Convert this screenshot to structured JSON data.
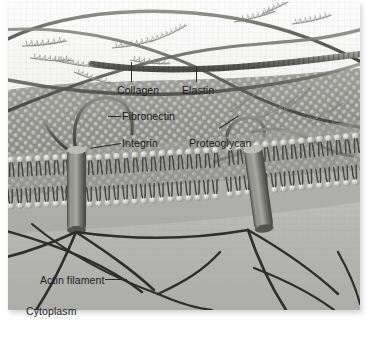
{
  "figure": {
    "style": "grayscale textbook illustration",
    "colors": {
      "background": "#ffffff",
      "plate_top": "#fbfbfb",
      "extracellular_matrix": "#9a9a98",
      "cytoplasm": "#b9b9b6",
      "fiber_dark": "#3a3a3a",
      "fiber_mid": "#6e6e6c",
      "label_text": "#1b1b1b",
      "leader_line": "#2a2a2a",
      "lipid_head": "#cfcfcb",
      "lipid_tail": "#4a4a48",
      "integrin": "#6b6b68"
    }
  },
  "labels": [
    {
      "id": "collagen",
      "text": "Collagen",
      "x": 117,
      "y": 84,
      "leader": "vertical-up"
    },
    {
      "id": "elastin",
      "text": "Elastin",
      "x": 182,
      "y": 84,
      "leader": "vertical-up"
    },
    {
      "id": "fibronectin",
      "text": "Fibronectin",
      "x": 122,
      "y": 110,
      "leader": "horizontal-left"
    },
    {
      "id": "integrin",
      "text": "Integrin",
      "x": 122,
      "y": 134,
      "leader": "diagonal-left"
    },
    {
      "id": "proteoglycan",
      "text": "Proteoglycan",
      "x": 189,
      "y": 134,
      "leader": "diagonal-up-right"
    },
    {
      "id": "actin-filament",
      "text": "Actin filament",
      "x": 40,
      "y": 274,
      "leader": "horizontal-right"
    },
    {
      "id": "cytoplasm",
      "text": "Cytoplasm",
      "x": 26,
      "y": 307,
      "leader": "none"
    }
  ],
  "structures": {
    "collagen_fibers": 3,
    "elastin_fibers": 2,
    "proteoglycan_clusters": 5,
    "integrins": 2,
    "actin_filaments": 9,
    "lipid_bilayer_leaflets": 2
  }
}
